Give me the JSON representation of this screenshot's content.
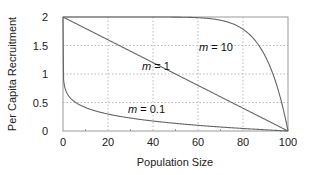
{
  "chart_data": {
    "type": "line",
    "title": "",
    "xlabel": "Population Size",
    "ylabel": "Per Capita Recruitment",
    "xlim": [
      0,
      100
    ],
    "ylim": [
      0,
      2
    ],
    "xticks": [
      0,
      20,
      40,
      60,
      80,
      100
    ],
    "yticks": [
      0,
      0.5,
      1,
      1.5,
      2
    ],
    "ytick_labels": [
      "0",
      "0.5",
      "1",
      "1.5",
      "2"
    ],
    "grid": true,
    "legend": "none (inline annotations)",
    "series": [
      {
        "name": "m = 0.1",
        "label_italic": "m",
        "label_rest": " = 0.1",
        "m": 0.1,
        "x": [
          0,
          1,
          5,
          10,
          20,
          40,
          60,
          80,
          100
        ],
        "values": [
          2.0,
          0.79,
          0.54,
          0.46,
          0.36,
          0.26,
          0.18,
          0.11,
          0
        ]
      },
      {
        "name": "m = 1",
        "label_italic": "m",
        "label_rest": " = 1",
        "m": 1,
        "x": [
          0,
          20,
          40,
          60,
          80,
          100
        ],
        "values": [
          2.0,
          1.6,
          1.2,
          0.8,
          0.4,
          0
        ]
      },
      {
        "name": "m = 10",
        "label_italic": "m",
        "label_rest": " = 10",
        "m": 10,
        "x": [
          0,
          40,
          60,
          70,
          80,
          90,
          95,
          100
        ],
        "values": [
          2.0,
          2.0,
          1.99,
          1.94,
          1.79,
          1.3,
          0.82,
          0
        ]
      }
    ],
    "model": "y = 2 * (1 - (x/100)^m)"
  }
}
